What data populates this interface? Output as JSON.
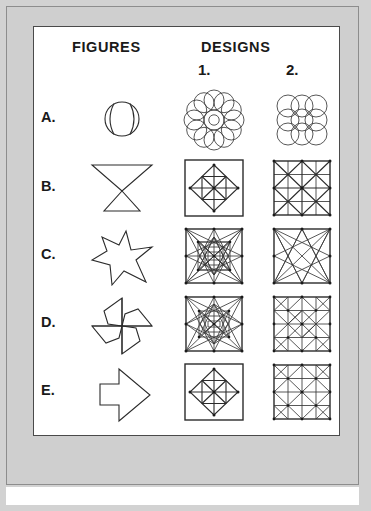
{
  "worksheet": {
    "headers": {
      "figures": "FIGURES",
      "designs": "DESIGNS",
      "column_1": "1.",
      "column_2": "2."
    },
    "colors": {
      "page_background": "#d2d2d2",
      "mat": "#cfcfcf",
      "plate": "#ffffff",
      "ink": "#2b2b2b",
      "frame": "#4a4a4a"
    },
    "rows": [
      {
        "label": "A.",
        "figure": {
          "name": "ball-two-arcs",
          "description": "circle with two inner vertical arcs (ball)"
        },
        "designs": [
          {
            "column": "1.",
            "name": "circle-rosette-radial",
            "description": "rosette of twelve overlapping circles around a center"
          },
          {
            "column": "2.",
            "name": "circle-grid-square",
            "description": "three by three square grid of overlapping circles"
          }
        ]
      },
      {
        "label": "B.",
        "figure": {
          "name": "bowtie-two-triangles",
          "description": "two triangles meeting at a point, hourglass"
        },
        "designs": [
          {
            "column": "1.",
            "name": "square-inscribed-diamond-cross",
            "description": "square with inscribed diamond, cross and diagonals"
          },
          {
            "column": "2.",
            "name": "square-quad-grid-full-diagonals",
            "description": "square split in quarters with all diagonals"
          }
        ]
      },
      {
        "label": "C.",
        "figure": {
          "name": "four-point-star-cross",
          "description": "four pointed star / pinwheel cross outline"
        },
        "designs": [
          {
            "column": "1.",
            "name": "dense-nested-star-burst",
            "description": "square frame with dense nested star burst of chords"
          },
          {
            "column": "2.",
            "name": "eight-point-star-open-center",
            "description": "square frame with eight pointed star and open center"
          }
        ]
      },
      {
        "label": "D.",
        "figure": {
          "name": "pinwheel-four-blades",
          "description": "pinwheel with four swept blades"
        },
        "designs": [
          {
            "column": "1.",
            "name": "dense-nested-star-burst-variant",
            "description": "square frame with dense nested star burst, alternate chords"
          },
          {
            "column": "2.",
            "name": "four-by-four-grid-diagonals",
            "description": "four by four grid with diagonal bands forming pinwheels"
          }
        ]
      },
      {
        "label": "E.",
        "figure": {
          "name": "right-arrow-outline",
          "description": "block arrow pointing right"
        },
        "designs": [
          {
            "column": "1.",
            "name": "square-inscribed-diamond-cross-small",
            "description": "square with inscribed diamond, cross and spokes"
          },
          {
            "column": "2.",
            "name": "four-by-four-grid-diagonals-variant",
            "description": "four by four grid with alternating diagonal triangles"
          }
        ]
      }
    ]
  }
}
